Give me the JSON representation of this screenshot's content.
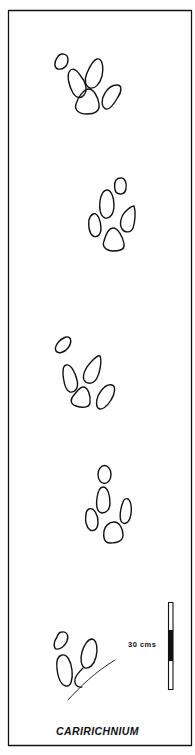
{
  "figure": {
    "title": "CARIRICHNIUM",
    "scale_bar": {
      "label": "30 cms",
      "length_value": 30,
      "unit": "cms"
    },
    "colors": {
      "ink": "#111111",
      "background": "#ffffff"
    },
    "footprints": [
      {
        "name": "footprint-1",
        "digits": 5
      },
      {
        "name": "footprint-2",
        "digits": 5
      },
      {
        "name": "footprint-3",
        "digits": 5
      },
      {
        "name": "footprint-4",
        "digits": 5
      },
      {
        "name": "footprint-5",
        "digits": 3
      }
    ]
  }
}
